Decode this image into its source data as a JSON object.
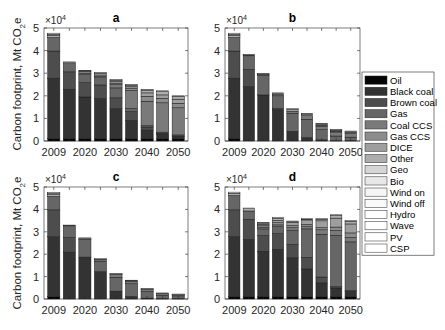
{
  "figure": {
    "ylabel": "Carbon footprint, Mt CO",
    "ylabel_sub": "2",
    "ylabel_tail": "e",
    "multiplier": "×10",
    "multiplier_exp": "4"
  },
  "chart_data": [
    {
      "type": "bar",
      "stacked": true,
      "title": "a",
      "xlabel": "",
      "ylabel": "Carbon footprint, Mt CO2e",
      "ylim": [
        0,
        50000
      ],
      "yticks": [
        0,
        1,
        2,
        3,
        4,
        5
      ],
      "ytick_multiplier": "x10^4",
      "xtick_labels": [
        "2009",
        "2020",
        "2030",
        "2040",
        "2050"
      ],
      "categories": [
        "2009",
        "2015",
        "2020",
        "2025",
        "2030",
        "2035",
        "2040",
        "2045",
        "2050"
      ],
      "totals": [
        47700,
        35000,
        31300,
        30300,
        27200,
        25000,
        22800,
        22200,
        20000
      ],
      "series": [
        {
          "name": "Oil",
          "values": [
            1000,
            1000,
            1000,
            1000,
            1000,
            1000,
            1000,
            1000,
            1000
          ]
        },
        {
          "name": "Black coal",
          "values": [
            26800,
            21900,
            18500,
            17800,
            13300,
            8100,
            3800,
            2000,
            1000
          ]
        },
        {
          "name": "Brown coal",
          "values": [
            12000,
            7700,
            6300,
            6000,
            4800,
            3900,
            1400,
            400,
            200
          ]
        },
        {
          "name": "Gas",
          "values": [
            6000,
            3600,
            3600,
            3200,
            4400,
            1400,
            600,
            500,
            500
          ]
        },
        {
          "name": "Coal CCS",
          "values": [
            0,
            0,
            0,
            0,
            1400,
            8000,
            10800,
            13000,
            12000
          ]
        },
        {
          "name": "Gas CCS",
          "values": [
            0,
            0,
            600,
            600,
            700,
            1000,
            2200,
            2000,
            2000
          ]
        },
        {
          "name": "DICE",
          "values": [
            0,
            0,
            600,
            600,
            700,
            700,
            1500,
            1500,
            1800
          ]
        },
        {
          "name": "Other",
          "values": [
            1000,
            500,
            400,
            800,
            600,
            600,
            1200,
            1500,
            1300
          ]
        },
        {
          "name": "Geo",
          "values": [
            400,
            0,
            0,
            0,
            0,
            0,
            0,
            0,
            0
          ]
        },
        {
          "name": "Bio",
          "values": [
            500,
            300,
            300,
            300,
            300,
            300,
            300,
            300,
            200
          ]
        }
      ]
    },
    {
      "type": "bar",
      "stacked": true,
      "title": "b",
      "ylim": [
        0,
        50000
      ],
      "yticks": [
        0,
        1,
        2,
        3,
        4,
        5
      ],
      "ytick_multiplier": "x10^4",
      "xtick_labels": [
        "2009",
        "2020",
        "2030",
        "2040",
        "2050"
      ],
      "categories": [
        "2009",
        "2015",
        "2020",
        "2025",
        "2030",
        "2035",
        "2040",
        "2045",
        "2050"
      ],
      "totals": [
        47700,
        38300,
        29900,
        21300,
        14300,
        12200,
        7800,
        5100,
        4400
      ],
      "series": [
        {
          "name": "Oil",
          "values": [
            1000,
            0,
            0,
            0,
            0,
            0,
            0,
            0,
            0
          ]
        },
        {
          "name": "Black coal",
          "values": [
            26800,
            24000,
            20400,
            13800,
            4300,
            1500,
            500,
            200,
            200
          ]
        },
        {
          "name": "Brown coal",
          "values": [
            12000,
            7700,
            0,
            600,
            0,
            0,
            0,
            0,
            0
          ]
        },
        {
          "name": "Gas",
          "values": [
            6000,
            6000,
            8800,
            5600,
            8000,
            8100,
            4500,
            2000,
            1500
          ]
        },
        {
          "name": "Coal CCS",
          "values": [
            0,
            0,
            0,
            600,
            900,
            1600,
            1600,
            1800,
            1600
          ]
        },
        {
          "name": "Gas CCS",
          "values": [
            0,
            0,
            0,
            0,
            0,
            0,
            400,
            400,
            500
          ]
        },
        {
          "name": "DICE",
          "values": [
            0,
            0,
            0,
            0,
            0,
            0,
            0,
            0,
            0
          ]
        },
        {
          "name": "Other",
          "values": [
            1000,
            300,
            400,
            400,
            800,
            700,
            500,
            400,
            400
          ]
        },
        {
          "name": "Geo",
          "values": [
            400,
            0,
            0,
            0,
            0,
            0,
            0,
            0,
            0
          ]
        },
        {
          "name": "Bio",
          "values": [
            500,
            300,
            300,
            300,
            300,
            300,
            300,
            300,
            200
          ]
        }
      ]
    },
    {
      "type": "bar",
      "stacked": true,
      "title": "c",
      "ylim": [
        0,
        50000
      ],
      "yticks": [
        0,
        1,
        2,
        3,
        4,
        5
      ],
      "ytick_multiplier": "x10^4",
      "xtick_labels": [
        "2009",
        "2020",
        "2030",
        "2040",
        "2050"
      ],
      "categories": [
        "2009",
        "2015",
        "2020",
        "2025",
        "2030",
        "2035",
        "2040",
        "2045",
        "2050"
      ],
      "totals": [
        47600,
        33000,
        27300,
        18000,
        11400,
        8400,
        4700,
        2700,
        2200
      ],
      "series": [
        {
          "name": "Oil",
          "values": [
            1000,
            0,
            0,
            0,
            0,
            0,
            0,
            0,
            0
          ]
        },
        {
          "name": "Black coal",
          "values": [
            26800,
            20900,
            18700,
            12200,
            3500,
            1100,
            400,
            200,
            200
          ]
        },
        {
          "name": "Brown coal",
          "values": [
            12000,
            6600,
            0,
            0,
            0,
            0,
            0,
            0,
            0
          ]
        },
        {
          "name": "Gas",
          "values": [
            6000,
            4800,
            8000,
            4600,
            6200,
            5700,
            3000,
            1400,
            1200
          ]
        },
        {
          "name": "Coal CCS",
          "values": [
            0,
            0,
            0,
            800,
            1200,
            1200,
            900,
            800,
            500
          ]
        },
        {
          "name": "Gas CCS",
          "values": [
            0,
            0,
            0,
            0,
            0,
            0,
            0,
            0,
            0
          ]
        },
        {
          "name": "DICE",
          "values": [
            0,
            0,
            0,
            0,
            0,
            0,
            0,
            0,
            0
          ]
        },
        {
          "name": "Other",
          "values": [
            900,
            400,
            300,
            100,
            200,
            100,
            100,
            100,
            100
          ]
        },
        {
          "name": "Geo",
          "values": [
            400,
            0,
            0,
            0,
            0,
            0,
            0,
            0,
            0
          ]
        },
        {
          "name": "Bio",
          "values": [
            500,
            300,
            300,
            300,
            300,
            300,
            300,
            200,
            200
          ]
        }
      ]
    },
    {
      "type": "bar",
      "stacked": true,
      "title": "d",
      "ylim": [
        0,
        50000
      ],
      "yticks": [
        0,
        1,
        2,
        3,
        4,
        5
      ],
      "ytick_multiplier": "x10^4",
      "xtick_labels": [
        "2009",
        "2020",
        "2030",
        "2040",
        "2050"
      ],
      "categories": [
        "2009",
        "2015",
        "2020",
        "2025",
        "2030",
        "2035",
        "2040",
        "2045",
        "2050"
      ],
      "totals": [
        47700,
        40600,
        34200,
        35500,
        34800,
        35900,
        35900,
        37600,
        35000
      ],
      "series": [
        {
          "name": "Oil",
          "values": [
            1000,
            1000,
            1000,
            1000,
            1000,
            1000,
            1000,
            1000,
            1000
          ]
        },
        {
          "name": "Black coal",
          "values": [
            26800,
            25600,
            20300,
            21200,
            17400,
            12400,
            6200,
            3900,
            2400
          ]
        },
        {
          "name": "Brown coal",
          "values": [
            12000,
            9000,
            7000,
            7000,
            6000,
            5200,
            2600,
            600,
            400
          ]
        },
        {
          "name": "Gas",
          "values": [
            6400,
            3700,
            3000,
            3100,
            6200,
            12700,
            19100,
            22900,
            21700
          ]
        },
        {
          "name": "Coal CCS",
          "values": [
            0,
            0,
            800,
            800,
            1200,
            1000,
            2000,
            2200,
            2000
          ]
        },
        {
          "name": "Gas CCS",
          "values": [
            0,
            0,
            600,
            1000,
            1000,
            1000,
            1000,
            1500,
            2000
          ]
        },
        {
          "name": "DICE",
          "values": [
            0,
            0,
            600,
            1000,
            1500,
            2000,
            3000,
            4000,
            4000
          ]
        },
        {
          "name": "Other",
          "values": [
            1000,
            1000,
            600,
            900,
            300,
            300,
            700,
            1200,
            1200
          ]
        },
        {
          "name": "Geo",
          "values": [
            0,
            0,
            0,
            0,
            0,
            0,
            0,
            0,
            0
          ]
        },
        {
          "name": "Bio",
          "values": [
            500,
            300,
            300,
            500,
            200,
            300,
            300,
            300,
            300
          ]
        }
      ]
    }
  ],
  "legend": {
    "position": "right",
    "entries": [
      {
        "name": "Oil",
        "color": "#050505"
      },
      {
        "name": "Black coal",
        "color": "#333333"
      },
      {
        "name": "Brown coal",
        "color": "#4d4d4d"
      },
      {
        "name": "Gas",
        "color": "#666666"
      },
      {
        "name": "Coal CCS",
        "color": "#7a7a7a"
      },
      {
        "name": "Gas CCS",
        "color": "#8c8c8c"
      },
      {
        "name": "DICE",
        "color": "#9e9e9e"
      },
      {
        "name": "Other",
        "color": "#adadad"
      },
      {
        "name": "Geo",
        "color": "#d6d6d6"
      },
      {
        "name": "Bio",
        "color": "#e8e8e8"
      },
      {
        "name": "Wind on",
        "color": "#f5f5f5"
      },
      {
        "name": "Wind off",
        "color": "#fafafa"
      },
      {
        "name": "Hydro",
        "color": "#ffffff"
      },
      {
        "name": "Wave",
        "color": "#ffffff"
      },
      {
        "name": "PV",
        "color": "#ffffff"
      },
      {
        "name": "CSP",
        "color": "#ffffff"
      }
    ]
  }
}
